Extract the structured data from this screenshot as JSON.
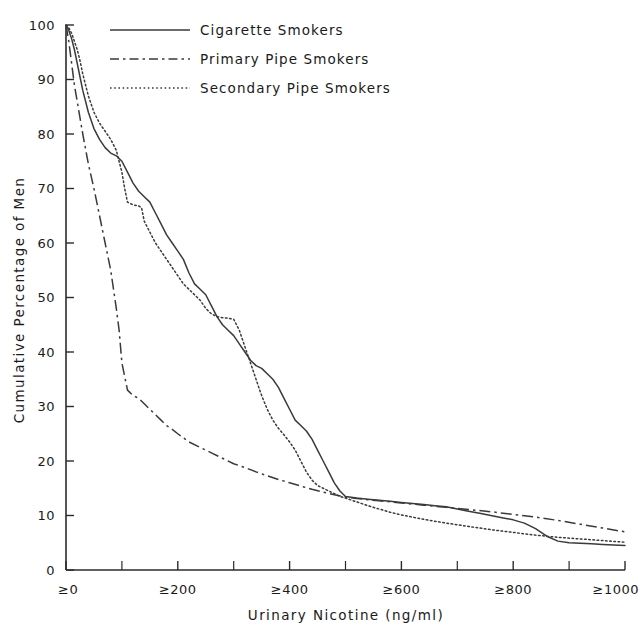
{
  "chart_data": {
    "type": "line",
    "title": "",
    "xlabel": "Urinary Nicotine (ng/ml)",
    "ylabel": "Cumulative Percentage of Men",
    "xlim": [
      0,
      1000
    ],
    "ylim": [
      0,
      100
    ],
    "grid": false,
    "legend_position": "top-left-inside",
    "x_tick_labels": [
      "≥0",
      "≥200",
      "≥400",
      "≥600",
      "≥800",
      "≥1000"
    ],
    "x_tick_values": [
      0,
      200,
      400,
      600,
      800,
      1000
    ],
    "x_minor_tick_values": [
      100,
      300,
      500,
      700,
      900
    ],
    "y_tick_labels": [
      "0",
      "10",
      "20",
      "30",
      "40",
      "50",
      "60",
      "70",
      "80",
      "90",
      "100"
    ],
    "y_tick_values": [
      0,
      10,
      20,
      30,
      40,
      50,
      60,
      70,
      80,
      90,
      100
    ],
    "series": [
      {
        "name": "Cigarette Smokers",
        "style": "solid",
        "color": "#3a3a3a",
        "x": [
          0,
          5,
          10,
          15,
          20,
          25,
          30,
          40,
          50,
          60,
          70,
          80,
          90,
          100,
          110,
          120,
          130,
          140,
          150,
          160,
          170,
          180,
          190,
          200,
          210,
          220,
          230,
          240,
          250,
          260,
          270,
          280,
          290,
          300,
          310,
          320,
          330,
          340,
          350,
          360,
          370,
          380,
          390,
          400,
          410,
          420,
          430,
          440,
          450,
          460,
          470,
          480,
          490,
          500,
          520,
          540,
          560,
          580,
          600,
          620,
          640,
          660,
          680,
          700,
          720,
          740,
          760,
          780,
          800,
          820,
          840,
          860,
          880,
          900,
          920,
          940,
          960,
          980,
          1000
        ],
        "y": [
          100,
          99,
          97.5,
          95.5,
          93,
          90.5,
          88,
          84,
          81,
          79,
          77.5,
          76.5,
          76,
          75,
          73,
          71,
          69.5,
          68.5,
          67.5,
          65.5,
          63.5,
          61.5,
          60,
          58.5,
          57,
          54.5,
          52.5,
          51.5,
          50.5,
          48.5,
          46.5,
          45,
          44,
          43,
          41.5,
          40,
          38.5,
          37.5,
          37,
          36,
          35,
          33.5,
          31.5,
          29.5,
          27.5,
          26.5,
          25.5,
          24,
          22,
          20,
          18,
          16,
          14.5,
          13.5,
          13.2,
          13,
          12.8,
          12.6,
          12.4,
          12.2,
          12,
          11.8,
          11.6,
          11.2,
          10.8,
          10.4,
          10,
          9.6,
          9.2,
          8.6,
          7.6,
          6.2,
          5.3,
          5,
          4.9,
          4.8,
          4.7,
          4.6,
          4.5
        ]
      },
      {
        "name": "Primary Pipe Smokers",
        "style": "dashdot",
        "color": "#3a3a3a",
        "x": [
          0,
          5,
          10,
          15,
          20,
          25,
          30,
          40,
          50,
          60,
          70,
          80,
          90,
          95,
          100,
          110,
          120,
          130,
          140,
          150,
          160,
          170,
          180,
          190,
          200,
          220,
          240,
          260,
          280,
          300,
          320,
          340,
          360,
          380,
          400,
          420,
          440,
          460,
          480,
          500,
          520,
          540,
          560,
          580,
          600,
          640,
          680,
          720,
          760,
          800,
          840,
          880,
          920,
          960,
          1000
        ],
        "y": [
          100,
          97,
          93,
          89,
          86,
          83,
          80,
          74.5,
          70,
          65,
          60,
          55,
          48,
          44,
          38,
          33,
          32,
          31.5,
          30.5,
          29.5,
          28.5,
          27.5,
          26.5,
          25.8,
          25,
          23.5,
          22.5,
          21.5,
          20.5,
          19.5,
          18.8,
          18,
          17.3,
          16.6,
          16,
          15.4,
          14.8,
          14.3,
          13.8,
          13.4,
          13.1,
          12.9,
          12.7,
          12.5,
          12.3,
          11.9,
          11.5,
          11.1,
          10.7,
          10.2,
          9.7,
          9.1,
          8.4,
          7.7,
          7.0
        ]
      },
      {
        "name": "Secondary Pipe Smokers",
        "style": "dotted",
        "color": "#3a3a3a",
        "x": [
          0,
          5,
          10,
          15,
          20,
          25,
          30,
          40,
          50,
          60,
          70,
          80,
          90,
          100,
          105,
          110,
          120,
          130,
          135,
          140,
          150,
          160,
          170,
          180,
          190,
          200,
          210,
          215,
          220,
          230,
          240,
          250,
          260,
          270,
          280,
          290,
          300,
          310,
          320,
          330,
          340,
          350,
          360,
          370,
          380,
          390,
          400,
          410,
          420,
          430,
          440,
          450,
          460,
          470,
          480,
          490,
          500,
          520,
          540,
          560,
          580,
          600,
          640,
          680,
          720,
          760,
          800,
          840,
          880,
          920,
          960,
          1000
        ],
        "y": [
          100,
          99.5,
          98.5,
          97,
          95.5,
          93.5,
          91,
          87,
          84,
          82,
          80.5,
          79,
          77,
          73,
          70,
          67.5,
          67,
          66.8,
          66.5,
          64,
          62,
          60,
          58.5,
          57,
          55.5,
          54,
          52.5,
          52,
          51.5,
          50.5,
          49.5,
          48,
          47,
          46.5,
          46.3,
          46.2,
          46,
          44,
          41,
          38,
          35,
          32,
          29.5,
          27.5,
          26,
          24.8,
          23.5,
          22,
          20,
          18,
          16.5,
          15.5,
          15,
          14.5,
          14,
          13.5,
          13.2,
          12.5,
          11.8,
          11.2,
          10.6,
          10.1,
          9.3,
          8.6,
          8.0,
          7.4,
          6.9,
          6.4,
          6.0,
          5.7,
          5.4,
          5.1
        ]
      }
    ]
  },
  "legend": {
    "entries": [
      {
        "label": "Cigarette Smokers",
        "style": "solid"
      },
      {
        "label": "Primary Pipe Smokers",
        "style": "dashdot"
      },
      {
        "label": "Secondary Pipe Smokers",
        "style": "dotted"
      }
    ]
  }
}
